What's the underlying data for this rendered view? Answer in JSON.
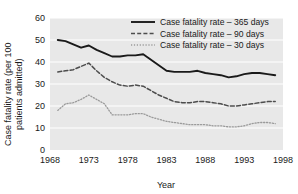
{
  "chart_data": {
    "type": "line",
    "title": "",
    "xlabel": "Year",
    "ylabel": "Case fatality rate (per 100 patients admitted)",
    "xlim": [
      1968,
      1998
    ],
    "ylim": [
      0,
      60
    ],
    "xticks": [
      1968,
      1973,
      1978,
      1983,
      1988,
      1993,
      1998
    ],
    "yticks": [
      0,
      10,
      20,
      30,
      40,
      50,
      60
    ],
    "grid": true,
    "grid_axis": "y",
    "plot_background": "#e8e8e8",
    "legend_position": "top-right",
    "x": [
      1969,
      1970,
      1971,
      1972,
      1973,
      1974,
      1975,
      1976,
      1977,
      1978,
      1979,
      1980,
      1981,
      1982,
      1983,
      1984,
      1985,
      1986,
      1987,
      1988,
      1989,
      1990,
      1991,
      1992,
      1993,
      1994,
      1995,
      1996,
      1997
    ],
    "series": [
      {
        "name": "Case fatality rate – 365 days",
        "style": "solid",
        "color": "#1a1a1a",
        "values": [
          50.0,
          49.5,
          48.0,
          46.5,
          47.5,
          45.5,
          44.0,
          42.5,
          42.5,
          43.0,
          43.0,
          43.5,
          41.0,
          38.5,
          36.0,
          35.5,
          35.5,
          35.5,
          36.0,
          35.0,
          34.5,
          34.0,
          33.0,
          33.5,
          34.5,
          35.0,
          35.0,
          34.5,
          34.0
        ]
      },
      {
        "name": "Case fatality rate – 90 days",
        "style": "dashed",
        "color": "#4d4d4d",
        "values": [
          35.5,
          36.0,
          36.5,
          38.0,
          39.5,
          36.0,
          33.0,
          31.0,
          29.5,
          29.0,
          29.5,
          29.0,
          27.0,
          25.0,
          23.5,
          22.0,
          21.5,
          21.5,
          22.0,
          22.0,
          21.5,
          21.0,
          20.0,
          20.0,
          20.5,
          21.0,
          21.5,
          22.0,
          22.0
        ]
      },
      {
        "name": "Case fatality rate – 30 days",
        "style": "dotted",
        "color": "#9a9a9a",
        "values": [
          18.0,
          21.0,
          21.5,
          23.0,
          25.0,
          23.0,
          21.0,
          16.0,
          16.0,
          16.0,
          16.5,
          16.5,
          15.0,
          14.0,
          13.0,
          12.5,
          12.0,
          11.5,
          11.5,
          11.5,
          11.0,
          11.0,
          10.5,
          10.5,
          11.0,
          12.0,
          12.5,
          12.5,
          12.0
        ]
      }
    ]
  },
  "legend": {
    "items": [
      {
        "label": "Case fatality rate – 365 days"
      },
      {
        "label": "Case fatality rate – 90 days"
      },
      {
        "label": "Case fatality rate – 30 days"
      }
    ]
  },
  "axes": {
    "ylabel_line1": "Case fatality rate (per 100",
    "ylabel_line2": "patients admitted)",
    "xlabel": "Year"
  }
}
